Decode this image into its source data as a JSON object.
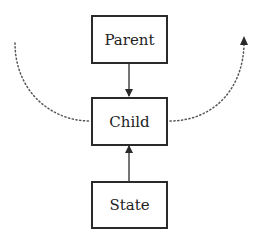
{
  "diagram": {
    "nodes": [
      {
        "id": "parent",
        "label": "Parent"
      },
      {
        "id": "child",
        "label": "Child"
      },
      {
        "id": "state",
        "label": "State"
      }
    ],
    "edges": [
      {
        "from": "parent",
        "to": "child",
        "style": "solid"
      },
      {
        "from": "state",
        "to": "child",
        "style": "solid"
      },
      {
        "from": "left-outside",
        "to": "child",
        "style": "dotted"
      },
      {
        "from": "child",
        "to": "right-outside",
        "style": "dotted"
      }
    ],
    "colors": {
      "stroke": "#2a2a2a",
      "dotted": "#555555",
      "background": "#ffffff"
    }
  }
}
